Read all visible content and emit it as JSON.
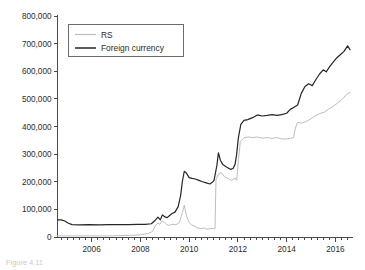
{
  "figure": {
    "caption_fragment": "Figure 4.11"
  },
  "legend": {
    "position": "upper-left-inside",
    "items": [
      {
        "label": "RS",
        "color": "#bdbdbd",
        "name": "legend-item-rs"
      },
      {
        "label": "Foreign currency",
        "color": "#262626",
        "name": "legend-item-foreign-currency"
      }
    ]
  },
  "axes": {
    "y_ticks": [
      "0",
      "100,000",
      "200,000",
      "300,000",
      "400,000",
      "500,000",
      "600,000",
      "700,000",
      "800,000"
    ],
    "x_ticks": [
      "2006",
      "2008",
      "2010",
      "2012",
      "2014",
      "2016"
    ]
  },
  "chart_data": {
    "type": "line",
    "title": "",
    "subtitle": "",
    "xlabel": "",
    "ylabel": "",
    "xlim": [
      2004.6,
      2016.7
    ],
    "ylim": [
      0,
      800000
    ],
    "ytick_values": [
      0,
      100000,
      200000,
      300000,
      400000,
      500000,
      600000,
      700000,
      800000
    ],
    "xtick_values": [
      2006,
      2008,
      2010,
      2012,
      2014,
      2016
    ],
    "xminor_tick_interval": 0.25,
    "grid": false,
    "legend_position": "upper left",
    "series": [
      {
        "name": "RS",
        "color": "#bdbdbd",
        "linewidth": 1.0,
        "x": [
          2004.6,
          2004.8,
          2005.0,
          2005.3,
          2005.6,
          2006.0,
          2006.4,
          2006.8,
          2007.2,
          2007.6,
          2008.0,
          2008.3,
          2008.5,
          2008.62,
          2008.72,
          2008.8,
          2008.9,
          2009.0,
          2009.1,
          2009.2,
          2009.3,
          2009.45,
          2009.6,
          2009.72,
          2009.8,
          2009.9,
          2010.0,
          2010.1,
          2010.2,
          2010.35,
          2010.5,
          2010.62,
          2010.75,
          2010.85,
          2010.95,
          2011.02,
          2011.06,
          2011.1,
          2011.2,
          2011.32,
          2011.45,
          2011.6,
          2011.72,
          2011.8,
          2011.88,
          2011.95,
          2012.02,
          2012.1,
          2012.25,
          2012.45,
          2012.6,
          2012.8,
          2013.0,
          2013.2,
          2013.4,
          2013.6,
          2013.8,
          2014.0,
          2014.15,
          2014.28,
          2014.36,
          2014.45,
          2014.6,
          2014.8,
          2015.0,
          2015.2,
          2015.4,
          2015.55,
          2015.7,
          2015.9,
          2016.1,
          2016.3,
          2016.45,
          2016.6
        ],
        "values": [
          4000,
          4000,
          4000,
          4000,
          4000,
          4000,
          4000,
          4000,
          5000,
          6000,
          8000,
          12000,
          20000,
          42000,
          50000,
          46000,
          58000,
          52000,
          44000,
          42000,
          46000,
          44000,
          52000,
          88000,
          115000,
          74000,
          52000,
          44000,
          40000,
          33000,
          30000,
          33000,
          28000,
          30000,
          31000,
          30000,
          30000,
          208000,
          228000,
          233000,
          218000,
          212000,
          205000,
          208000,
          214000,
          205000,
          280000,
          345000,
          360000,
          362000,
          360000,
          362000,
          358000,
          360000,
          357000,
          360000,
          355000,
          355000,
          357000,
          360000,
          395000,
          415000,
          412000,
          418000,
          428000,
          440000,
          448000,
          452000,
          462000,
          472000,
          486000,
          500000,
          516000,
          523000
        ]
      },
      {
        "name": "Foreign currency",
        "color": "#262626",
        "linewidth": 1.2,
        "x": [
          2004.6,
          2004.75,
          2004.9,
          2005.05,
          2005.2,
          2005.5,
          2005.9,
          2006.3,
          2006.7,
          2007.1,
          2007.5,
          2007.9,
          2008.2,
          2008.45,
          2008.6,
          2008.72,
          2008.82,
          2008.9,
          2009.0,
          2009.1,
          2009.2,
          2009.3,
          2009.42,
          2009.55,
          2009.65,
          2009.72,
          2009.8,
          2009.88,
          2010.0,
          2010.12,
          2010.25,
          2010.4,
          2010.55,
          2010.7,
          2010.85,
          2010.95,
          2011.02,
          2011.08,
          2011.14,
          2011.2,
          2011.28,
          2011.38,
          2011.5,
          2011.6,
          2011.7,
          2011.8,
          2011.88,
          2011.95,
          2012.02,
          2012.12,
          2012.25,
          2012.4,
          2012.6,
          2012.8,
          2013.0,
          2013.2,
          2013.4,
          2013.6,
          2013.8,
          2014.0,
          2014.15,
          2014.3,
          2014.45,
          2014.6,
          2014.75,
          2014.9,
          2015.05,
          2015.2,
          2015.35,
          2015.5,
          2015.62,
          2015.75,
          2015.9,
          2016.05,
          2016.2,
          2016.35,
          2016.5,
          2016.6
        ],
        "values": [
          62000,
          62000,
          58000,
          50000,
          45000,
          44000,
          45000,
          44000,
          45000,
          45000,
          45000,
          46000,
          46000,
          48000,
          60000,
          72000,
          62000,
          80000,
          73000,
          70000,
          78000,
          85000,
          90000,
          110000,
          150000,
          200000,
          238000,
          232000,
          215000,
          212000,
          210000,
          205000,
          200000,
          196000,
          192000,
          198000,
          205000,
          232000,
          260000,
          305000,
          278000,
          262000,
          255000,
          250000,
          245000,
          248000,
          262000,
          300000,
          360000,
          408000,
          422000,
          425000,
          432000,
          442000,
          438000,
          440000,
          443000,
          440000,
          443000,
          448000,
          462000,
          470000,
          478000,
          520000,
          545000,
          555000,
          548000,
          570000,
          590000,
          605000,
          598000,
          615000,
          632000,
          648000,
          660000,
          672000,
          692000,
          678000
        ]
      }
    ]
  }
}
